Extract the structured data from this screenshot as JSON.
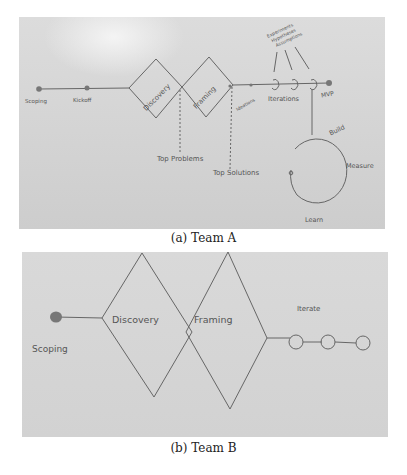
{
  "figure": {
    "subfigures": [
      {
        "id": "a",
        "caption": "(a) Team A",
        "labels": {
          "scoping": "Scoping",
          "kickoff": "Kickoff",
          "discovery": "Discovery",
          "framing": "Framing",
          "top_problems": "Top Problems",
          "top_solutions": "Top Solutions",
          "ideations": "Ideations",
          "experiments_line1": "Experiments",
          "experiments_line2": "Hypotheses",
          "experiments_line3": "Assumptions",
          "iterations": "Iterations",
          "mvp": "MVP",
          "build": "Build",
          "measure": "Measure",
          "learn": "Learn"
        }
      },
      {
        "id": "b",
        "caption": "(b) Team B",
        "labels": {
          "scoping": "Scoping",
          "discovery": "Discovery",
          "framing": "Framing",
          "iterate": "Iterate"
        }
      }
    ]
  }
}
